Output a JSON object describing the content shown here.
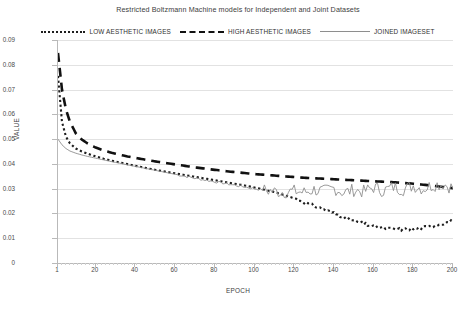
{
  "chart_data": {
    "type": "line",
    "title": "Restricted Boltzmann Machine models for Independent and Joint Datasets",
    "xlabel": "EPOCH",
    "ylabel": "VALUE",
    "xlim": [
      1,
      200
    ],
    "ylim": [
      0,
      0.09
    ],
    "grid": true,
    "legend_position": "top-center",
    "yticks": [
      "0.09",
      "0.08",
      "0.07",
      "0.06",
      "0.05",
      "0.04",
      "0.03",
      "0.02",
      "0.01",
      "0"
    ],
    "ytick_values": [
      0.09,
      0.08,
      0.07,
      0.06,
      0.05,
      0.04,
      0.03,
      0.02,
      0.01,
      0
    ],
    "xticks": [
      "1",
      "20",
      "40",
      "60",
      "80",
      "100",
      "120",
      "140",
      "160",
      "180",
      "200"
    ],
    "xtick_values": [
      1,
      20,
      40,
      60,
      80,
      100,
      120,
      140,
      160,
      180,
      200
    ],
    "x": [
      1,
      3,
      5,
      7,
      10,
      13,
      16,
      20,
      24,
      28,
      32,
      36,
      40,
      45,
      50,
      55,
      60,
      65,
      70,
      75,
      80,
      85,
      90,
      95,
      100,
      105,
      110,
      115,
      120,
      125,
      130,
      135,
      140,
      145,
      150,
      155,
      160,
      165,
      170,
      175,
      180,
      185,
      190,
      195,
      200
    ],
    "series": [
      {
        "name": "LOW AESTHETIC IMAGES",
        "style": "dotted",
        "color": "#1e1e1e",
        "values": [
          0.0755,
          0.057,
          0.051,
          0.0483,
          0.0462,
          0.045,
          0.0441,
          0.043,
          0.0421,
          0.0413,
          0.0406,
          0.0399,
          0.0392,
          0.0384,
          0.0376,
          0.0369,
          0.0362,
          0.0355,
          0.0348,
          0.0341,
          0.0334,
          0.0327,
          0.032,
          0.0313,
          0.0305,
          0.0296,
          0.0286,
          0.0274,
          0.0261,
          0.0246,
          0.0231,
          0.0216,
          0.0201,
          0.0185,
          0.017,
          0.0158,
          0.0148,
          0.0141,
          0.0137,
          0.0136,
          0.0138,
          0.0143,
          0.015,
          0.016,
          0.017
        ]
      },
      {
        "name": "HIGH AESTHETIC IMAGES",
        "style": "dashed",
        "color": "#111111",
        "values": [
          0.0848,
          0.07,
          0.062,
          0.057,
          0.0523,
          0.0498,
          0.0482,
          0.0466,
          0.0454,
          0.0445,
          0.0437,
          0.043,
          0.0424,
          0.0417,
          0.041,
          0.0404,
          0.0398,
          0.0392,
          0.0386,
          0.0381,
          0.0376,
          0.0371,
          0.0367,
          0.0363,
          0.0359,
          0.0356,
          0.0353,
          0.035,
          0.0347,
          0.0344,
          0.0342,
          0.034,
          0.0338,
          0.0336,
          0.0334,
          0.0332,
          0.033,
          0.0328,
          0.0326,
          0.0323,
          0.032,
          0.0316,
          0.0312,
          0.0307,
          0.0302
        ]
      },
      {
        "name": "JOINED IMAGESET",
        "style": "solid",
        "color": "#8e8e8e",
        "values": [
          0.05,
          0.0477,
          0.0462,
          0.0452,
          0.0443,
          0.0436,
          0.043,
          0.0423,
          0.0416,
          0.0409,
          0.0403,
          0.0396,
          0.039,
          0.0382,
          0.0374,
          0.0366,
          0.0358,
          0.035,
          0.0342,
          0.0335,
          0.0328,
          0.0321,
          0.0314,
          0.0307,
          0.03,
          0.0294,
          0.0289,
          0.0287,
          0.029,
          0.0285,
          0.0296,
          0.0288,
          0.0302,
          0.0284,
          0.0295,
          0.0288,
          0.0305,
          0.0292,
          0.0307,
          0.0298,
          0.0312,
          0.03,
          0.0315,
          0.032,
          0.0302
        ]
      }
    ],
    "noise": {
      "JOINED IMAGESET": {
        "start_epoch": 105,
        "description": "high-frequency oscillation between 0.026 and 0.033 after epoch 105"
      }
    }
  }
}
